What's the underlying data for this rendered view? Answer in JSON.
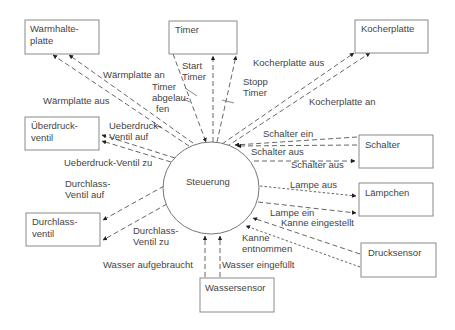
{
  "diagram": {
    "type": "context-diagram",
    "center": {
      "label": "Steuerung",
      "color": "#777777"
    },
    "entities": {
      "warmhalteplatte": {
        "line1": "Warmhalte-",
        "line2": "platte"
      },
      "timer": {
        "line1": "Timer"
      },
      "kocherplatte": {
        "line1": "Kocherplatte"
      },
      "ueberdruckventil": {
        "line1": "Überdruck-",
        "line2": "ventil"
      },
      "schalter": {
        "line1": "Schalter"
      },
      "durchlassventil": {
        "line1": "Durchlass-",
        "line2": "ventil"
      },
      "laempchen": {
        "line1": "Lämpchen"
      },
      "drucksensor": {
        "line1": "Drucksensor"
      },
      "wassersensor": {
        "line1": "Wassersensor"
      }
    },
    "flows": {
      "waermplatte_an": {
        "label": "Wärmplatte an",
        "from": "Steuerung",
        "to": "Warmhalteplatte"
      },
      "waermplatte_aus": {
        "label": "Wärmplatte aus",
        "from": "Steuerung",
        "to": "Warmhalteplatte"
      },
      "timer_abgelaufen": {
        "line1": "Timer",
        "line2": "abgelau-",
        "line3": "fen",
        "from": "Timer",
        "to": "Steuerung"
      },
      "start_timer": {
        "line1": "Start",
        "line2": "Timer",
        "from": "Steuerung",
        "to": "Timer"
      },
      "stopp_timer": {
        "line1": "Stopp",
        "line2": "Timer",
        "from": "Steuerung",
        "to": "Timer"
      },
      "kocherplatte_aus": {
        "label": "Kocherplatte aus",
        "from": "Steuerung",
        "to": "Kocherplatte"
      },
      "kocherplatte_an": {
        "label": "Kocherplatte an",
        "from": "Steuerung",
        "to": "Kocherplatte"
      },
      "ueberdruck_ventil_auf": {
        "line1": "Ueberdruck-",
        "line2": "Ventil auf",
        "from": "Steuerung",
        "to": "Überdruckventil"
      },
      "ueberdruck_ventil_zu": {
        "label": "Ueberdruck-Ventil zu",
        "from": "Steuerung",
        "to": "Überdruckventil"
      },
      "schalter_ein": {
        "label": "Schalter ein",
        "from": "Schalter",
        "to": "Steuerung"
      },
      "schalter_aus_in": {
        "label": "Schalter aus",
        "from": "Schalter",
        "to": "Steuerung"
      },
      "schalter_aus_out": {
        "label": "Schalter aus",
        "from": "Steuerung",
        "to": "Schalter"
      },
      "durchlass_ventil_auf": {
        "line1": "Durchlass-",
        "line2": "Ventil auf",
        "from": "Steuerung",
        "to": "Durchlassventil"
      },
      "durchlass_ventil_zu": {
        "line1": "Durchlass-",
        "line2": "Ventil zu",
        "from": "Steuerung",
        "to": "Durchlassventil"
      },
      "lampe_aus": {
        "label": "Lampe aus",
        "from": "Steuerung",
        "to": "Lämpchen"
      },
      "lampe_ein": {
        "label": "Lampe ein",
        "from": "Steuerung",
        "to": "Lämpchen"
      },
      "kanne_eingestellt": {
        "label": "Kanne eingestellt",
        "from": "Drucksensor",
        "to": "Steuerung"
      },
      "kanne_entnommen": {
        "line1": "Kanne",
        "line2": "entnommen",
        "from": "Drucksensor",
        "to": "Steuerung"
      },
      "wasser_aufgebraucht": {
        "label": "Wasser aufgebraucht",
        "from": "Wassersensor",
        "to": "Steuerung"
      },
      "wasser_eingefuellt": {
        "label": "Wasser eingefüllt",
        "from": "Wassersensor",
        "to": "Steuerung"
      }
    }
  }
}
